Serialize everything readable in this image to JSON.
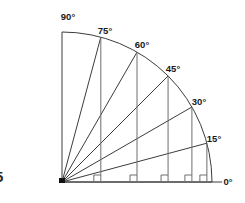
{
  "figure": {
    "origin": {
      "x": 62,
      "y": 182
    },
    "radius": 150,
    "arc": {
      "start_angle": 0,
      "end_angle": 90
    },
    "baseline": {
      "x1": 62,
      "y1": 182,
      "x2": 222,
      "y2": 182
    },
    "edge_label": "5",
    "colors": {
      "line": "#3c3c3c",
      "drop_line": "#6e6e6e",
      "text": "#1a1a1a",
      "background": "#ffffff",
      "vertex": "#111111"
    },
    "rays": [
      {
        "angle": 0,
        "label": "0°",
        "label_x": 228,
        "label_y": 182,
        "anchor": "middle",
        "has_drop_line": false,
        "has_right_angle": false
      },
      {
        "angle": 15,
        "label": "15°",
        "label_x": 214,
        "label_y": 139,
        "anchor": "middle",
        "has_drop_line": true,
        "has_right_angle": true
      },
      {
        "angle": 30,
        "label": "30°",
        "label_x": 199,
        "label_y": 102,
        "anchor": "middle",
        "has_drop_line": true,
        "has_right_angle": true
      },
      {
        "angle": 45,
        "label": "45°",
        "label_x": 173,
        "label_y": 69,
        "anchor": "middle",
        "has_drop_line": true,
        "has_right_angle": true
      },
      {
        "angle": 60,
        "label": "60°",
        "label_x": 142,
        "label_y": 45,
        "anchor": "middle",
        "has_drop_line": true,
        "has_right_angle": true
      },
      {
        "angle": 75,
        "label": "75°",
        "label_x": 105,
        "label_y": 31,
        "anchor": "middle",
        "has_drop_line": true,
        "has_right_angle": true
      },
      {
        "angle": 90,
        "label": "90°",
        "label_x": 68,
        "label_y": 17,
        "anchor": "middle",
        "has_drop_line": false,
        "has_right_angle": false
      }
    ]
  }
}
